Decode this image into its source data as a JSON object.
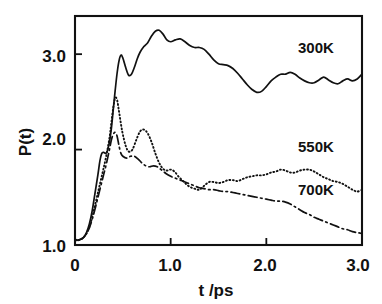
{
  "figure": {
    "kind": "scientific-line-plot",
    "background_color": "#ffffff",
    "ink_color": "#111111"
  },
  "chart_data": {
    "type": "line",
    "title": "",
    "xlabel": "t /ps",
    "ylabel": "P(t)",
    "xlim": [
      0,
      3.0
    ],
    "ylim": [
      1.0,
      3.4
    ],
    "xticks": [
      0,
      1.0,
      2.0,
      3.0
    ],
    "xtick_labels": [
      "0",
      "1.0",
      "2.0",
      "3.0"
    ],
    "yticks": [
      1.0,
      2.0,
      3.0
    ],
    "ytick_labels": [
      "1.0",
      "2.0",
      "3.0"
    ],
    "grid": false,
    "legend_position": "inline-annotations",
    "annotations": [
      {
        "text": "300K",
        "x": 2.35,
        "y": 3.02
      },
      {
        "text": "550K",
        "x": 2.35,
        "y": 1.93
      },
      {
        "text": "700K",
        "x": 2.35,
        "y": 1.46
      }
    ],
    "series": [
      {
        "name": "300K",
        "label": "300K",
        "line_style": "solid",
        "stroke_width": 1.7,
        "x": [
          0.0,
          0.03,
          0.06,
          0.09,
          0.12,
          0.15,
          0.18,
          0.21,
          0.24,
          0.26,
          0.28,
          0.3,
          0.32,
          0.34,
          0.36,
          0.38,
          0.4,
          0.42,
          0.44,
          0.46,
          0.48,
          0.5,
          0.53,
          0.56,
          0.59,
          0.62,
          0.65,
          0.68,
          0.72,
          0.76,
          0.8,
          0.84,
          0.88,
          0.92,
          0.96,
          1.0,
          1.05,
          1.1,
          1.15,
          1.2,
          1.25,
          1.3,
          1.35,
          1.4,
          1.45,
          1.5,
          1.55,
          1.6,
          1.65,
          1.7,
          1.75,
          1.8,
          1.85,
          1.9,
          1.95,
          2.0,
          2.05,
          2.1,
          2.15,
          2.2,
          2.25,
          2.3,
          2.35,
          2.4,
          2.45,
          2.5,
          2.55,
          2.6,
          2.65,
          2.7,
          2.75,
          2.8,
          2.85,
          2.9,
          2.95,
          3.0
        ],
        "y": [
          1.06,
          1.05,
          1.06,
          1.08,
          1.13,
          1.22,
          1.36,
          1.55,
          1.74,
          1.88,
          1.96,
          1.97,
          1.96,
          1.99,
          2.08,
          2.22,
          2.42,
          2.62,
          2.8,
          2.93,
          2.99,
          2.96,
          2.86,
          2.78,
          2.79,
          2.86,
          2.95,
          3.02,
          3.08,
          3.12,
          3.19,
          3.24,
          3.25,
          3.21,
          3.15,
          3.13,
          3.15,
          3.16,
          3.13,
          3.09,
          3.07,
          3.07,
          3.05,
          3.0,
          2.94,
          2.9,
          2.89,
          2.88,
          2.85,
          2.8,
          2.74,
          2.68,
          2.63,
          2.6,
          2.61,
          2.66,
          2.72,
          2.76,
          2.79,
          2.79,
          2.81,
          2.79,
          2.75,
          2.72,
          2.7,
          2.7,
          2.73,
          2.76,
          2.73,
          2.7,
          2.69,
          2.72,
          2.74,
          2.72,
          2.74,
          2.79
        ]
      },
      {
        "name": "550K",
        "label": "550K",
        "line_style": "dotted",
        "stroke_width": 1.9,
        "x": [
          0.0,
          0.03,
          0.06,
          0.09,
          0.12,
          0.15,
          0.18,
          0.21,
          0.24,
          0.27,
          0.3,
          0.33,
          0.36,
          0.38,
          0.4,
          0.42,
          0.44,
          0.46,
          0.48,
          0.5,
          0.53,
          0.56,
          0.6,
          0.64,
          0.68,
          0.72,
          0.76,
          0.8,
          0.84,
          0.88,
          0.92,
          0.96,
          1.0,
          1.04,
          1.08,
          1.12,
          1.16,
          1.2,
          1.25,
          1.3,
          1.35,
          1.4,
          1.45,
          1.5,
          1.55,
          1.6,
          1.65,
          1.7,
          1.75,
          1.8,
          1.85,
          1.9,
          1.95,
          2.0,
          2.05,
          2.1,
          2.15,
          2.2,
          2.25,
          2.3,
          2.35,
          2.4,
          2.45,
          2.5,
          2.55,
          2.6,
          2.65,
          2.7,
          2.75,
          2.8,
          2.85,
          2.9,
          2.95,
          3.0
        ],
        "y": [
          1.06,
          1.05,
          1.06,
          1.08,
          1.12,
          1.19,
          1.29,
          1.42,
          1.55,
          1.68,
          1.81,
          1.95,
          2.12,
          2.28,
          2.44,
          2.54,
          2.52,
          2.4,
          2.27,
          2.16,
          2.04,
          1.98,
          2.0,
          2.1,
          2.19,
          2.21,
          2.17,
          2.08,
          1.96,
          1.86,
          1.8,
          1.78,
          1.79,
          1.77,
          1.72,
          1.68,
          1.64,
          1.61,
          1.59,
          1.58,
          1.62,
          1.66,
          1.66,
          1.65,
          1.66,
          1.68,
          1.68,
          1.67,
          1.69,
          1.71,
          1.72,
          1.73,
          1.73,
          1.74,
          1.76,
          1.77,
          1.79,
          1.78,
          1.76,
          1.76,
          1.78,
          1.79,
          1.79,
          1.77,
          1.74,
          1.71,
          1.69,
          1.67,
          1.66,
          1.64,
          1.61,
          1.58,
          1.56,
          1.58
        ]
      },
      {
        "name": "700K",
        "label": "700K",
        "line_style": "dash-dot",
        "stroke_width": 1.7,
        "x": [
          0.0,
          0.03,
          0.06,
          0.09,
          0.12,
          0.15,
          0.18,
          0.21,
          0.24,
          0.27,
          0.3,
          0.33,
          0.36,
          0.38,
          0.4,
          0.42,
          0.44,
          0.46,
          0.48,
          0.5,
          0.54,
          0.58,
          0.62,
          0.66,
          0.7,
          0.74,
          0.78,
          0.82,
          0.86,
          0.9,
          0.95,
          1.0,
          1.05,
          1.1,
          1.15,
          1.2,
          1.25,
          1.3,
          1.35,
          1.4,
          1.45,
          1.5,
          1.55,
          1.6,
          1.65,
          1.7,
          1.75,
          1.8,
          1.85,
          1.9,
          1.95,
          2.0,
          2.05,
          2.1,
          2.15,
          2.2,
          2.25,
          2.3,
          2.35,
          2.4,
          2.45,
          2.5,
          2.55,
          2.6,
          2.65,
          2.7,
          2.75,
          2.8,
          2.85,
          2.9,
          2.95,
          3.0
        ],
        "y": [
          1.05,
          1.05,
          1.06,
          1.08,
          1.12,
          1.18,
          1.27,
          1.38,
          1.5,
          1.62,
          1.74,
          1.86,
          2.0,
          2.1,
          2.16,
          2.18,
          2.14,
          2.04,
          1.96,
          1.93,
          1.91,
          1.93,
          1.93,
          1.9,
          1.86,
          1.83,
          1.82,
          1.83,
          1.82,
          1.79,
          1.75,
          1.72,
          1.7,
          1.68,
          1.66,
          1.64,
          1.62,
          1.6,
          1.59,
          1.58,
          1.58,
          1.57,
          1.56,
          1.56,
          1.55,
          1.54,
          1.53,
          1.52,
          1.51,
          1.5,
          1.49,
          1.48,
          1.47,
          1.46,
          1.46,
          1.45,
          1.43,
          1.4,
          1.37,
          1.34,
          1.32,
          1.29,
          1.27,
          1.25,
          1.23,
          1.21,
          1.19,
          1.17,
          1.16,
          1.14,
          1.13,
          1.12
        ]
      }
    ]
  },
  "axes_geometry": {
    "plot_left_px": 75,
    "plot_right_px": 362,
    "plot_top_px": 16,
    "plot_bottom_px": 245
  }
}
